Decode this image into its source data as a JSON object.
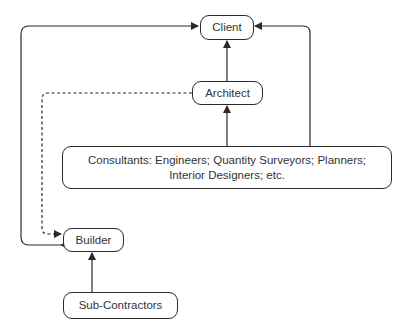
{
  "diagram": {
    "nodes": {
      "client": {
        "label": "Client"
      },
      "architect": {
        "label": "Architect"
      },
      "consultants": {
        "line1": "Consultants: Engineers; Quantity Surveyors; Planners;",
        "line2": "Interior Designers; etc."
      },
      "builder": {
        "label": "Builder"
      },
      "subcontractors": {
        "label": "Sub-Contractors"
      }
    },
    "edges": [
      {
        "from": "architect",
        "to": "client",
        "style": "solid"
      },
      {
        "from": "consultants",
        "to": "architect",
        "style": "solid"
      },
      {
        "from": "consultants",
        "to": "client",
        "style": "solid"
      },
      {
        "from": "builder",
        "to": "client",
        "style": "solid",
        "bidirectional": true
      },
      {
        "from": "architect",
        "to": "builder",
        "style": "dashed"
      },
      {
        "from": "subcontractors",
        "to": "builder",
        "style": "solid"
      }
    ],
    "colors": {
      "stroke": "#2a2a2a",
      "text": "#333333",
      "background": "#ffffff"
    }
  }
}
